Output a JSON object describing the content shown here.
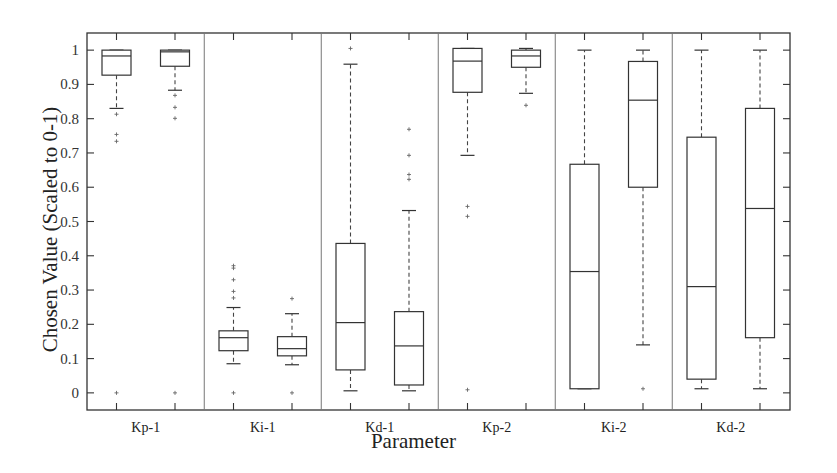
{
  "chart_data": {
    "type": "boxplot",
    "title": "",
    "xlabel": "Parameter",
    "ylabel": "Chosen Value (Scaled to 0-1)",
    "ylim": [
      -0.05,
      1.05
    ],
    "yticks": [
      0,
      0.1,
      0.2,
      0.3,
      0.4,
      0.5,
      0.6,
      0.7,
      0.8,
      0.9,
      1
    ],
    "ytick_labels": [
      "0",
      "0.1",
      "0.2",
      "0.3",
      "0.4",
      "0.5",
      "0.6",
      "0.7",
      "0.8",
      "0.9",
      "1"
    ],
    "grid": false,
    "categories": [
      "Kp-1",
      "Ki-1",
      "Kd-1",
      "Kp-2",
      "Ki-2",
      "Kd-2"
    ],
    "boxes_per_category": 2,
    "boxes": [
      {
        "category": "Kp-1",
        "index": 0,
        "whisker_low": 0.83,
        "q1": 0.927,
        "median": 0.983,
        "q3": 1.0,
        "whisker_high": 1.0,
        "outliers": [
          0.813,
          0.754,
          0.734,
          0.0
        ]
      },
      {
        "category": "Kp-1",
        "index": 1,
        "whisker_low": 0.883,
        "q1": 0.953,
        "median": 0.995,
        "q3": 1.0,
        "whisker_high": 1.0,
        "outliers": [
          0.868,
          0.833,
          0.801,
          0.0
        ]
      },
      {
        "category": "Ki-1",
        "index": 0,
        "whisker_low": 0.085,
        "q1": 0.123,
        "median": 0.161,
        "q3": 0.181,
        "whisker_high": 0.249,
        "outliers": [
          0.371,
          0.364,
          0.33,
          0.296,
          0.277,
          0.0
        ]
      },
      {
        "category": "Ki-1",
        "index": 1,
        "whisker_low": 0.082,
        "q1": 0.108,
        "median": 0.129,
        "q3": 0.164,
        "whisker_high": 0.231,
        "outliers": [
          0.275,
          0.0
        ]
      },
      {
        "category": "Kd-1",
        "index": 0,
        "whisker_low": 0.006,
        "q1": 0.067,
        "median": 0.205,
        "q3": 0.436,
        "whisker_high": 0.959,
        "outliers": [
          1.005
        ]
      },
      {
        "category": "Kd-1",
        "index": 1,
        "whisker_low": 0.006,
        "q1": 0.023,
        "median": 0.137,
        "q3": 0.237,
        "whisker_high": 0.532,
        "outliers": [
          0.769,
          0.693,
          0.637,
          0.623
        ]
      },
      {
        "category": "Kp-2",
        "index": 0,
        "whisker_low": 0.693,
        "q1": 0.877,
        "median": 0.968,
        "q3": 1.005,
        "whisker_high": 1.005,
        "outliers": [
          0.544,
          0.515,
          0.009
        ]
      },
      {
        "category": "Kp-2",
        "index": 1,
        "whisker_low": 0.874,
        "q1": 0.95,
        "median": 0.983,
        "q3": 1.0,
        "whisker_high": 1.005,
        "outliers": [
          0.839
        ]
      },
      {
        "category": "Ki-2",
        "index": 0,
        "whisker_low": 0.012,
        "q1": 0.012,
        "median": 0.354,
        "q3": 0.667,
        "whisker_high": 1.0,
        "outliers": []
      },
      {
        "category": "Ki-2",
        "index": 1,
        "whisker_low": 0.14,
        "q1": 0.6,
        "median": 0.854,
        "q3": 0.967,
        "whisker_high": 1.0,
        "outliers": [
          0.012
        ]
      },
      {
        "category": "Kd-2",
        "index": 0,
        "whisker_low": 0.012,
        "q1": 0.04,
        "median": 0.31,
        "q3": 0.746,
        "whisker_high": 1.0,
        "outliers": []
      },
      {
        "category": "Kd-2",
        "index": 1,
        "whisker_low": 0.012,
        "q1": 0.161,
        "median": 0.538,
        "q3": 0.83,
        "whisker_high": 1.0,
        "outliers": []
      }
    ]
  }
}
